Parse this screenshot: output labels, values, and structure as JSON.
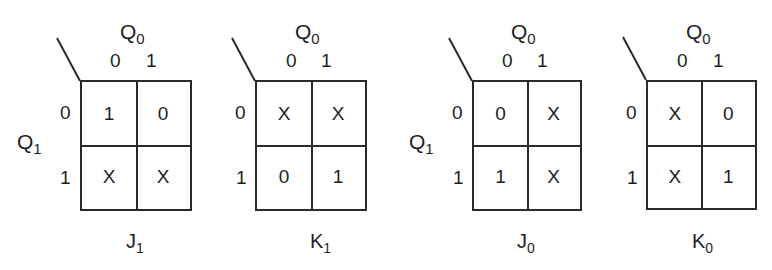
{
  "diagram": {
    "type": "karnaugh-maps",
    "column_variable": {
      "base": "Q",
      "sub": "0"
    },
    "row_variable": {
      "base": "Q",
      "sub": "1"
    },
    "column_labels": [
      "0",
      "1"
    ],
    "row_labels": [
      "0",
      "1"
    ],
    "maps": [
      {
        "name": {
          "base": "J",
          "sub": "1"
        },
        "show_row_var": true,
        "cells": [
          [
            "1",
            "0"
          ],
          [
            "X",
            "X"
          ]
        ]
      },
      {
        "name": {
          "base": "K",
          "sub": "1"
        },
        "show_row_var": false,
        "cells": [
          [
            "X",
            "X"
          ],
          [
            "0",
            "1"
          ]
        ]
      },
      {
        "name": {
          "base": "J",
          "sub": "0"
        },
        "show_row_var": true,
        "cells": [
          [
            "0",
            "X"
          ],
          [
            "1",
            "X"
          ]
        ]
      },
      {
        "name": {
          "base": "K",
          "sub": "0"
        },
        "show_row_var": false,
        "cells": [
          [
            "X",
            "0"
          ],
          [
            "X",
            "1"
          ]
        ]
      }
    ]
  }
}
